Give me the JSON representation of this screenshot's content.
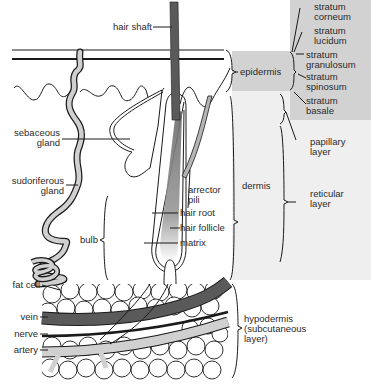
{
  "colors": {
    "shade_dark": "#c9c9c9",
    "shade_light": "#ececec",
    "vein": "#555555",
    "artery": "#cfcfcf",
    "nerve": "#1e1e1e",
    "line": "#1a1a1a",
    "gland": "#d0d0d0"
  },
  "labels": {
    "hair_shaft": "hair shaft",
    "sebaceous_gland": [
      "sebaceous",
      "gland"
    ],
    "sudoriferous_gland": [
      "sudoriferous",
      "gland"
    ],
    "bulb": "bulb",
    "arrector_pili": [
      "arrector",
      "pili"
    ],
    "hair_root": "hair root",
    "hair_follicle": "hair follicle",
    "matrix": "matrix",
    "fat_cell": "fat cell",
    "vein": "vein",
    "nerve": "nerve",
    "artery": "artery"
  },
  "layers": {
    "epidermis": "epidermis",
    "dermis": "dermis",
    "hypodermis": [
      "hypodermis",
      "(subcutaneous",
      "layer)"
    ],
    "papillary_layer": [
      "papillary",
      "layer"
    ],
    "reticular_layer": [
      "reticular",
      "layer"
    ]
  },
  "strata": [
    {
      "line1": "stratum",
      "line2": "corneum"
    },
    {
      "line1": "stratum",
      "line2": "lucidum"
    },
    {
      "line1": "stratum",
      "line2": "granulosum"
    },
    {
      "line1": "stratum",
      "line2": "spinosum"
    },
    {
      "line1": "stratum",
      "line2": "basale"
    }
  ]
}
